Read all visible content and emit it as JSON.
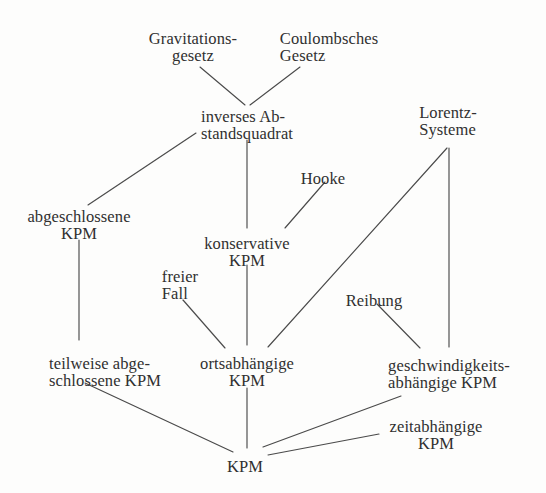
{
  "diagram": {
    "background_color": "#fdfdfc",
    "line_color": "#4a4a4a",
    "text_color": "#303030",
    "width": 546,
    "height": 493,
    "nodes": [
      {
        "id": "gravitationsgesetz",
        "lines": [
          "Gravitations-",
          "gesetz"
        ],
        "x": 193,
        "y": 30,
        "align": "center"
      },
      {
        "id": "coulombsches-gesetz",
        "lines": [
          "Coulombsches",
          "Gesetz"
        ],
        "x": 329,
        "y": 30,
        "align": "left"
      },
      {
        "id": "inverses-abstandsquadrat",
        "lines": [
          "inverses Ab-",
          "standsquadrat"
        ],
        "x": 247,
        "y": 108,
        "align": "left"
      },
      {
        "id": "lorentz-systeme",
        "lines": [
          "Lorentz-",
          "Systeme"
        ],
        "x": 448,
        "y": 104,
        "align": "left"
      },
      {
        "id": "hooke",
        "lines": [
          "Hooke"
        ],
        "x": 323,
        "y": 170,
        "align": "center"
      },
      {
        "id": "abgeschlossene-kpm",
        "lines": [
          "abgeschlossene",
          "KPM"
        ],
        "x": 79,
        "y": 208,
        "align": "center"
      },
      {
        "id": "konservative-kpm",
        "lines": [
          "konservative",
          "KPM"
        ],
        "x": 247,
        "y": 235,
        "align": "center"
      },
      {
        "id": "freier-fall",
        "lines": [
          "freier",
          "Fall"
        ],
        "x": 180,
        "y": 268,
        "align": "left"
      },
      {
        "id": "reibung",
        "lines": [
          "Reibung"
        ],
        "x": 374,
        "y": 292,
        "align": "center"
      },
      {
        "id": "teilweise-abgeschlossene-kpm",
        "lines": [
          "teilweise abge-",
          "schlossene KPM"
        ],
        "x": 105,
        "y": 355,
        "align": "left"
      },
      {
        "id": "ortsabhaengige-kpm",
        "lines": [
          "ortsabhängige",
          "KPM"
        ],
        "x": 247,
        "y": 355,
        "align": "center"
      },
      {
        "id": "geschwindigkeitsabhaengige-kpm",
        "lines": [
          "geschwindigkeits-",
          "abhängige KPM"
        ],
        "x": 449,
        "y": 357,
        "align": "left"
      },
      {
        "id": "zeitabhaengige-kpm",
        "lines": [
          "zeitabhängige",
          "KPM"
        ],
        "x": 436,
        "y": 418,
        "align": "center"
      },
      {
        "id": "kpm",
        "lines": [
          "KPM"
        ],
        "x": 245,
        "y": 458,
        "align": "center"
      }
    ],
    "edges": [
      {
        "id": "edge-gravitationsgesetz-inverses",
        "from": "gravitationsgesetz",
        "to": "inverses-abstandsquadrat",
        "x1": 200,
        "y1": 67,
        "x2": 245,
        "y2": 105
      },
      {
        "id": "edge-coulomb-inverses",
        "from": "coulombsches-gesetz",
        "to": "inverses-abstandsquadrat",
        "x1": 300,
        "y1": 67,
        "x2": 250,
        "y2": 105
      },
      {
        "id": "edge-inverses-abgeschlossene",
        "from": "inverses-abstandsquadrat",
        "to": "abgeschlossene-kpm",
        "x1": 196,
        "y1": 133,
        "x2": 88,
        "y2": 205
      },
      {
        "id": "edge-inverses-konservative",
        "from": "inverses-abstandsquadrat",
        "to": "konservative-kpm",
        "x1": 247,
        "y1": 140,
        "x2": 247,
        "y2": 228
      },
      {
        "id": "edge-hooke-konservative",
        "from": "hooke",
        "to": "konservative-kpm",
        "x1": 325,
        "y1": 182,
        "x2": 285,
        "y2": 228
      },
      {
        "id": "edge-lorentz-ortsabhaengige",
        "from": "lorentz-systeme",
        "to": "ortsabhaengige-kpm",
        "x1": 447,
        "y1": 148,
        "x2": 268,
        "y2": 347
      },
      {
        "id": "edge-lorentz-geschwindigkeitsabhaengige",
        "from": "lorentz-systeme",
        "to": "geschwindigkeitsabhaengige-kpm",
        "x1": 449,
        "y1": 148,
        "x2": 449,
        "y2": 347
      },
      {
        "id": "edge-abgeschlossene-teilweise",
        "from": "abgeschlossene-kpm",
        "to": "teilweise-abgeschlossene-kpm",
        "x1": 79,
        "y1": 240,
        "x2": 79,
        "y2": 340
      },
      {
        "id": "edge-konservative-ortsabhaengige",
        "from": "konservative-kpm",
        "to": "ortsabhaengige-kpm",
        "x1": 247,
        "y1": 265,
        "x2": 247,
        "y2": 345
      },
      {
        "id": "edge-freierfall-ortsabhaengige",
        "from": "freier-fall",
        "to": "ortsabhaengige-kpm",
        "x1": 183,
        "y1": 300,
        "x2": 225,
        "y2": 348
      },
      {
        "id": "edge-reibung-geschwindigkeitsabhaengige",
        "from": "reibung",
        "to": "geschwindigkeitsabhaengige-kpm",
        "x1": 377,
        "y1": 304,
        "x2": 420,
        "y2": 348
      },
      {
        "id": "edge-teilweise-kpm",
        "from": "teilweise-abgeschlossene-kpm",
        "to": "kpm",
        "x1": 85,
        "y1": 383,
        "x2": 233,
        "y2": 452
      },
      {
        "id": "edge-ortsabhaengige-kpm",
        "from": "ortsabhaengige-kpm",
        "to": "kpm",
        "x1": 247,
        "y1": 388,
        "x2": 247,
        "y2": 448
      },
      {
        "id": "edge-geschwindigkeitsabhaengige-kpm",
        "from": "geschwindigkeitsabhaengige-kpm",
        "to": "kpm",
        "x1": 401,
        "y1": 396,
        "x2": 263,
        "y2": 447
      },
      {
        "id": "edge-zeitabhaengige-kpm",
        "from": "zeitabhaengige-kpm",
        "to": "kpm",
        "x1": 379,
        "y1": 434,
        "x2": 268,
        "y2": 455
      }
    ]
  }
}
